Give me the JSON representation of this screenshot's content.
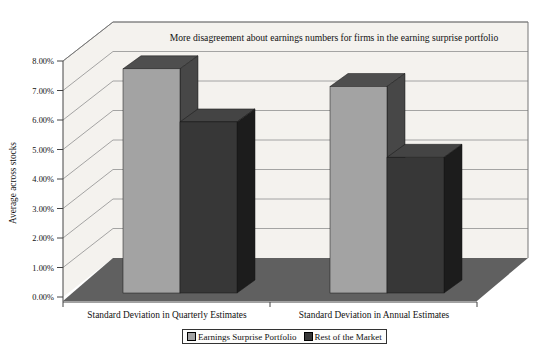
{
  "chart_data": {
    "type": "bar",
    "style": "3d-clustered-column",
    "title": "More disagreement about earnings numbers for firms in the earning surprise portfolio",
    "ylabel": "Average across stocks",
    "xlabel": "",
    "categories": [
      "Standard Deviation in Quarterly Estimates",
      "Standard Deviation in Annual Estimates"
    ],
    "series": [
      {
        "name": "Earnings Surprise Portfolio",
        "values": [
          7.6,
          7.0
        ],
        "color": "#a3a3a3",
        "top_color": "#4e4e4e",
        "side_color": "#474747"
      },
      {
        "name": "Rest of the Market",
        "values": [
          5.8,
          4.6
        ],
        "color": "#373737",
        "top_color": "#444444",
        "side_color": "#1c1c1c"
      }
    ],
    "unit": "percent",
    "ylim": [
      0,
      8
    ],
    "ytick_step": 1,
    "yticks": [
      "0.00%",
      "1.00%",
      "2.00%",
      "3.00%",
      "4.00%",
      "5.00%",
      "6.00%",
      "7.00%",
      "8.00%"
    ],
    "grid": true,
    "legend_position": "bottom",
    "wall_color": "#f4f2ee",
    "floor_color": "#606060",
    "gridline_color": "#8f8f8f",
    "axis_color": "#444444"
  }
}
